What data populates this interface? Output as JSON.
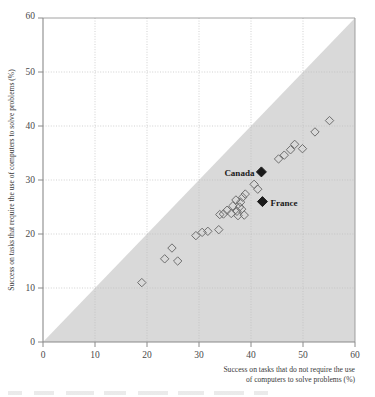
{
  "figure": {
    "background_color": "#ffffff",
    "shaded_region_color": "#d9d9d9",
    "marker_outline_color": "#6e6e6e",
    "highlight_marker_color": "#1a1a1a",
    "gridline_color": "#bfbfbf",
    "axis_color": "#7a7a7a"
  },
  "chart_data": {
    "type": "scatter",
    "title": "",
    "subtitle": "",
    "xlabel": "Success on tasks that do not require the use of computers to solve problems (%)",
    "ylabel": "Success on tasks that require the use of computers to solve problems (%)",
    "xlim": [
      0,
      60
    ],
    "ylim": [
      0,
      60
    ],
    "xticks": [
      0,
      10,
      20,
      30,
      40,
      50,
      60
    ],
    "yticks": [
      0,
      10,
      20,
      30,
      40,
      50,
      60
    ],
    "xtick_labels": [
      "0",
      "10",
      "20",
      "30",
      "40",
      "50",
      "60"
    ],
    "ytick_labels": [
      "0",
      "10",
      "20",
      "30",
      "40",
      "50",
      "60"
    ],
    "grid": true,
    "legend": false,
    "legend_position": "none",
    "annotations": [
      {
        "text": "Canada",
        "x": 42.0,
        "y": 31.5,
        "text_anchor": "end",
        "label_offset_x": -7,
        "label_offset_y": 1
      },
      {
        "text": "France",
        "x": 42.2,
        "y": 26.0,
        "text_anchor": "start",
        "label_offset_x": 8,
        "label_offset_y": 1
      }
    ],
    "shaded_region": {
      "description": "Grey triangle below the y = x diagonal",
      "vertices": [
        [
          0,
          0
        ],
        [
          60,
          0
        ],
        [
          60,
          60
        ]
      ]
    },
    "series": [
      {
        "name": "Countries (open diamonds)",
        "marker": "open-diamond",
        "points": [
          [
            19.0,
            11.0
          ],
          [
            23.4,
            15.4
          ],
          [
            24.8,
            17.4
          ],
          [
            25.9,
            15.0
          ],
          [
            29.4,
            19.7
          ],
          [
            30.6,
            20.3
          ],
          [
            31.7,
            20.5
          ],
          [
            33.8,
            20.8
          ],
          [
            34.0,
            23.6
          ],
          [
            34.7,
            23.7
          ],
          [
            35.4,
            24.4
          ],
          [
            36.2,
            23.8
          ],
          [
            36.5,
            25.2
          ],
          [
            37.1,
            26.3
          ],
          [
            37.3,
            24.2
          ],
          [
            37.5,
            23.4
          ],
          [
            37.8,
            25.0
          ],
          [
            38.0,
            25.9
          ],
          [
            38.2,
            24.6
          ],
          [
            38.4,
            26.8
          ],
          [
            38.7,
            23.5
          ],
          [
            38.9,
            27.4
          ],
          [
            40.6,
            29.2
          ],
          [
            41.3,
            28.3
          ],
          [
            45.3,
            33.9
          ],
          [
            46.4,
            34.6
          ],
          [
            47.6,
            35.6
          ],
          [
            48.4,
            36.6
          ],
          [
            49.9,
            35.8
          ],
          [
            52.3,
            38.9
          ],
          [
            55.1,
            41.0
          ]
        ]
      },
      {
        "name": "Highlighted countries (filled diamonds)",
        "marker": "filled-diamond",
        "points": [
          {
            "label": "Canada",
            "x": 42.0,
            "y": 31.5
          },
          {
            "label": "France",
            "x": 42.2,
            "y": 26.0
          }
        ]
      }
    ]
  }
}
